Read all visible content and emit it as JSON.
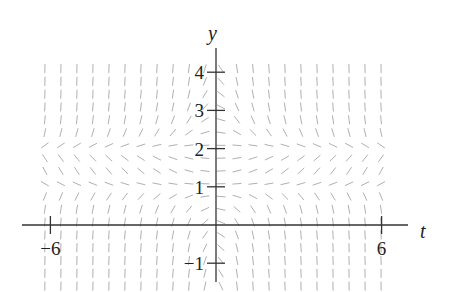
{
  "figure": {
    "type": "slope-field",
    "axes": {
      "x_label": "t",
      "y_label": "y",
      "x_ticks": [
        {
          "value": -6,
          "label": "−6"
        },
        {
          "value": 6,
          "label": "6"
        }
      ],
      "y_ticks": [
        {
          "value": 4,
          "label": "4"
        },
        {
          "value": 3,
          "label": "3"
        },
        {
          "value": 2,
          "label": "2"
        },
        {
          "value": 1,
          "label": "1"
        },
        {
          "value": -1,
          "label": "−1"
        }
      ],
      "x_range": [
        -7,
        7
      ],
      "y_range": [
        -1.5,
        4.5
      ]
    },
    "field": {
      "description": "Slope field with horizontal (equilibrium) slopes along y = 1 and y = 2; slopes change sign across t = 0",
      "equilibria_y": [
        1,
        2
      ],
      "t_min": -6.2,
      "t_max": 6.4,
      "t_step": 0.58,
      "y_min": -1.6,
      "y_max": 4.3,
      "y_step": 0.335
    },
    "colors": {
      "axis": "#333333",
      "segment": "#b0b0b0",
      "text": "#222222"
    }
  }
}
